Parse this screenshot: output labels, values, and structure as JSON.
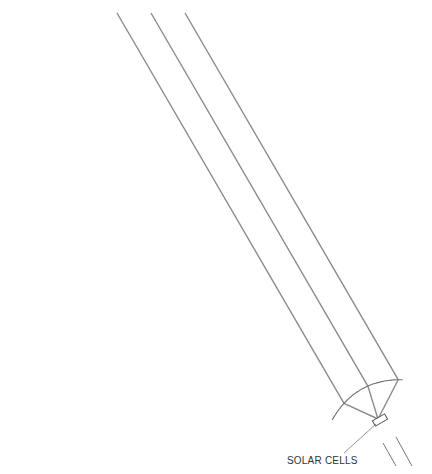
{
  "diagram": {
    "label_solar_cells": "SOLAR CELLS",
    "colors": {
      "ray": "#8a8a8a",
      "mirror": "#6e6e6e",
      "text": "#333333",
      "background": "#ffffff"
    },
    "focus": {
      "x": 378,
      "y": 419
    },
    "incoming_rays_top_x": [
      16,
      50,
      84,
      117,
      151,
      185,
      218,
      251,
      286,
      320
    ],
    "extra_ray_start": {
      "x": 10,
      "y": 65
    },
    "mirror_rim_left": {
      "x": 140,
      "y": 311
    },
    "mirror_rim_right": {
      "x": 407,
      "y": 157
    }
  }
}
